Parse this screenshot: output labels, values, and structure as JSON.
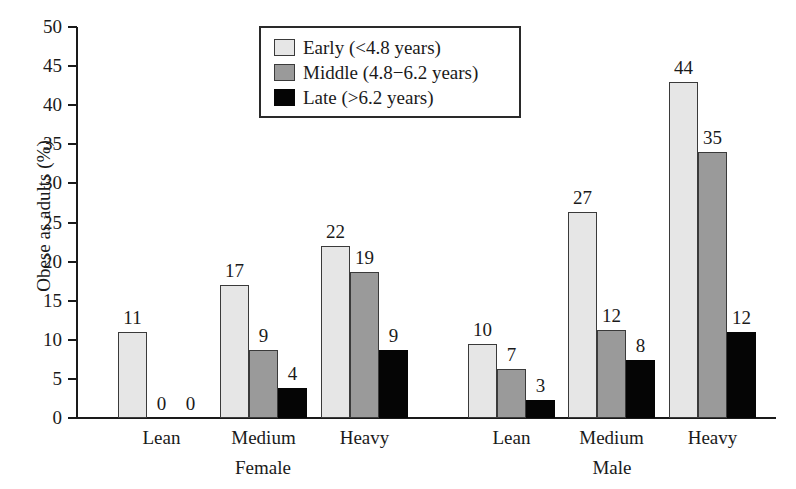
{
  "chart_data": {
    "type": "bar",
    "title": "",
    "xlabel": "",
    "ylabel": "Obese as adults (%)",
    "ylim": [
      0,
      50
    ],
    "ytick_step": 5,
    "yticks": [
      "50",
      "45",
      "40",
      "35",
      "30",
      "25",
      "20",
      "15",
      "10",
      "5",
      "0"
    ],
    "grid": false,
    "legend_position": "top-center",
    "categories": [
      "Lean",
      "Medium",
      "Heavy",
      "Lean",
      "Medium",
      "Heavy"
    ],
    "groups": [
      {
        "name": "Female",
        "categories": [
          "Lean",
          "Medium",
          "Heavy"
        ]
      },
      {
        "name": "Male",
        "categories": [
          "Lean",
          "Medium",
          "Heavy"
        ]
      }
    ],
    "series": [
      {
        "name": "Early (<4.8 years)",
        "key": "early",
        "color": "#e6e6e6",
        "values": [
          11,
          17,
          22,
          10,
          27,
          44
        ],
        "plotted": [
          11.0,
          17.0,
          22.0,
          9.5,
          26.3,
          43.0
        ]
      },
      {
        "name": "Middle (4.8−6.2 years)",
        "key": "middle",
        "color": "#9a9a9a",
        "values": [
          0,
          9,
          19,
          7,
          12,
          35
        ],
        "plotted": [
          0,
          8.7,
          18.7,
          6.3,
          11.3,
          34.0
        ]
      },
      {
        "name": "Late (>6.2 years)",
        "key": "late",
        "color": "#050505",
        "values": [
          0,
          4,
          9,
          3,
          8,
          12
        ],
        "plotted": [
          0,
          3.8,
          8.7,
          2.3,
          7.4,
          11.0
        ]
      }
    ],
    "legend_entries": [
      "Early (<4.8 years)",
      "Middle (4.8−6.2 years)",
      "Late (>6.2 years)"
    ]
  },
  "axis": {
    "y_title": "Obese as adults (%)"
  }
}
